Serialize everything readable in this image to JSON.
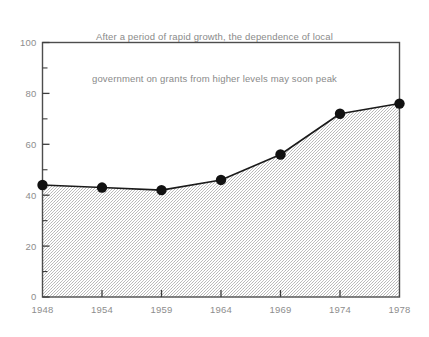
{
  "chart_data": {
    "type": "line",
    "title": "After a period of rapid growth, the dependence of local government on grants from higher levels may soon peak",
    "title_lines": [
      "After a period of rapid growth, the dependence of local",
      "government on grants from higher levels may soon peak"
    ],
    "xlabel": "",
    "ylabel": "",
    "categories": [
      "1948",
      "1954",
      "1959",
      "1964",
      "1969",
      "1974",
      "1978"
    ],
    "x": [
      1948,
      1954,
      1959,
      1964,
      1969,
      1974,
      1978
    ],
    "values": [
      44,
      43,
      42,
      46,
      56,
      72,
      76
    ],
    "series": [
      {
        "name": "Dependence of local government on grants from higher levels",
        "values": [
          44,
          43,
          42,
          46,
          56,
          72,
          76
        ]
      }
    ],
    "ylim": [
      0,
      100
    ],
    "y_ticks": [
      0,
      20,
      40,
      60,
      80,
      100
    ],
    "y_tick_labels": [
      "0",
      "20",
      "40",
      "60",
      "80",
      "100"
    ],
    "y_minor_ticks": [
      10,
      30,
      50,
      70,
      90
    ],
    "x_tick_labels": [
      "1948",
      "1954",
      "1959",
      "1964",
      "1969",
      "1974",
      "1978"
    ],
    "grid": false,
    "legend": null,
    "legend_position": "none",
    "fill": "stipple-gray",
    "marker": "filled-circle",
    "annotations": [],
    "colors": {
      "line": "#1a1a1a",
      "marker": "#111111",
      "fill": "#c9c9c9",
      "axis": "#555555",
      "tick_label": "#8d8d8d",
      "title": "#8a8a8a",
      "background": "#ffffff"
    }
  }
}
